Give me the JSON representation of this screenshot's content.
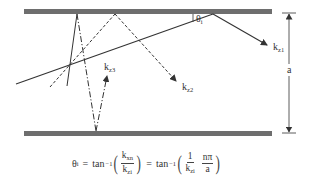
{
  "diagram": {
    "plates": {
      "top": {
        "x1": 24,
        "x2": 272,
        "y": 11,
        "thickness": 5,
        "color": "#6e6e6e"
      },
      "bottom": {
        "x1": 24,
        "x2": 272,
        "y": 133,
        "thickness": 5,
        "color": "#6e6e6e"
      }
    },
    "labels": {
      "theta": {
        "text": "θ",
        "sub": "i"
      },
      "kz1": {
        "text": "k",
        "sub": "z1"
      },
      "kz2": {
        "text": "k",
        "sub": "z2"
      },
      "kz3": {
        "text": "k",
        "sub": "z3"
      },
      "a": {
        "text": "a"
      }
    },
    "rays": [
      {
        "name": "ray-kz1",
        "style": "solid",
        "points": [
          [
            16,
            84
          ],
          [
            213,
            14
          ],
          [
            268,
            45
          ]
        ]
      },
      {
        "name": "ray-kz2",
        "style": "dashed",
        "points": [
          [
            50,
            87
          ],
          [
            115,
            14
          ],
          [
            178,
            82
          ]
        ]
      },
      {
        "name": "ray-kz3",
        "style": "dash-dot",
        "points": [
          [
            59,
            86
          ],
          [
            77,
            14
          ],
          [
            95,
            130
          ],
          [
            107,
            75
          ]
        ]
      }
    ],
    "dimension": {
      "label": "a",
      "x": 289,
      "y_top": 13,
      "y_bottom": 133
    }
  },
  "formula": {
    "lhs": {
      "symbol": "θ",
      "sub": "i"
    },
    "eq1": "=",
    "tan1": {
      "fn": "tan",
      "sup": "−1"
    },
    "frac1": {
      "num": "k",
      "num_sub": "xn",
      "den": "k",
      "den_sub": "zi"
    },
    "eq2": "=",
    "tan2": {
      "fn": "tan",
      "sup": "−1"
    },
    "frac2": {
      "num": "1",
      "den": "k",
      "den_sub": "zi"
    },
    "frac3": {
      "num": "nπ",
      "den": "a"
    }
  }
}
